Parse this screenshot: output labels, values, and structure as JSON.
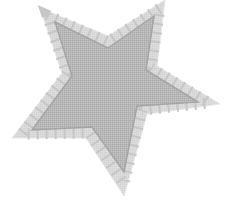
{
  "image": {
    "subject": "star",
    "description": "Five-pointed star with a quilted stitched border",
    "colors": {
      "background": "#ffffff",
      "border_fill": "#d9d9d9",
      "inner_fill": "#b3b3b3",
      "stitch": "#a6a6a6",
      "block_line": "#c2c2c2"
    },
    "outer_points": "40,8 108,36 165,0 157,66 220,104 147,114 124,196 86,138 12,138 62,73",
    "inner_points": "55,22 108,48 154,16 146,70 198,102 137,106 124,172 92,127 32,130 72,76"
  }
}
